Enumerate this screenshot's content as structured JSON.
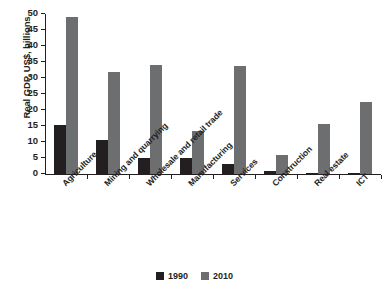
{
  "chart_data": {
    "type": "bar",
    "title": "",
    "xlabel": "",
    "ylabel": "Real GDP, US$, billions",
    "ylim": [
      0,
      50
    ],
    "ytick_step": 5,
    "yticks": [
      "50",
      "45",
      "40",
      "35",
      "30",
      "25",
      "20",
      "15",
      "10",
      "5",
      "0"
    ],
    "grid": false,
    "legend_position": "bottom-center",
    "categories": [
      "Agriculture",
      "Mining and quarrying",
      "Wholesale and retail trade",
      "Manufacturing",
      "Services",
      "Construction",
      "Real estate",
      "ICT"
    ],
    "series": [
      {
        "name": "1990",
        "color": "#231f20",
        "values": [
          15.2,
          10.5,
          5.0,
          5.0,
          3.0,
          1.0,
          0.4,
          0.3
        ]
      },
      {
        "name": "2010",
        "color": "#6d6e70",
        "values": [
          49.2,
          32.0,
          34.0,
          13.5,
          33.8,
          6.0,
          15.5,
          22.5
        ]
      }
    ]
  },
  "legend": {
    "items": [
      {
        "label": "1990",
        "color": "#231f20"
      },
      {
        "label": "2010",
        "color": "#6d6e70"
      }
    ]
  }
}
